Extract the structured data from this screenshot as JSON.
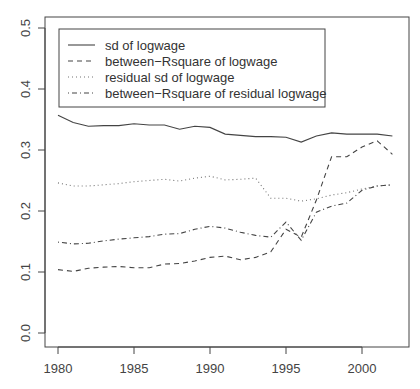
{
  "chart_data": {
    "type": "line",
    "title": "",
    "xlabel": "",
    "ylabel": "",
    "xlim": [
      1979,
      2003
    ],
    "ylim": [
      -0.02,
      0.52
    ],
    "grid": false,
    "legend_position": "top-left",
    "x_ticks": [
      1980,
      1985,
      1990,
      1995,
      2000
    ],
    "x_tick_labels": [
      "1980",
      "1985",
      "1990",
      "1995",
      "2000"
    ],
    "y_ticks": [
      0.0,
      0.1,
      0.2,
      0.3,
      0.4,
      0.5
    ],
    "y_tick_labels": [
      "0.0",
      "0.1",
      "0.2",
      "0.3",
      "0.4",
      "0.5"
    ],
    "x": [
      1980,
      1981,
      1982,
      1983,
      1984,
      1985,
      1986,
      1987,
      1988,
      1989,
      1990,
      1991,
      1992,
      1993,
      1994,
      1995,
      1996,
      1997,
      1998,
      1999,
      2000,
      2001,
      2002
    ],
    "series": [
      {
        "name": "sd of logwage",
        "line_style": "solid",
        "values": [
          0.357,
          0.345,
          0.339,
          0.34,
          0.34,
          0.343,
          0.341,
          0.341,
          0.334,
          0.339,
          0.337,
          0.326,
          0.324,
          0.322,
          0.322,
          0.321,
          0.313,
          0.323,
          0.328,
          0.326,
          0.326,
          0.326,
          0.323
        ]
      },
      {
        "name": "between-Rsquare of logwage",
        "line_style": "dashed",
        "values": [
          0.104,
          0.101,
          0.106,
          0.108,
          0.109,
          0.107,
          0.107,
          0.113,
          0.114,
          0.118,
          0.124,
          0.126,
          0.12,
          0.124,
          0.133,
          0.17,
          0.157,
          0.218,
          0.289,
          0.289,
          0.305,
          0.315,
          0.293
        ]
      },
      {
        "name": "residual sd of logwage",
        "line_style": "dotted",
        "values": [
          0.246,
          0.241,
          0.241,
          0.243,
          0.245,
          0.248,
          0.25,
          0.252,
          0.249,
          0.254,
          0.257,
          0.251,
          0.252,
          0.254,
          0.221,
          0.221,
          0.216,
          0.22,
          0.226,
          0.23,
          0.236,
          0.241,
          0.243
        ]
      },
      {
        "name": "between-Rsquare of residual logwage",
        "line_style": "dotdash",
        "values": [
          0.149,
          0.146,
          0.147,
          0.151,
          0.154,
          0.156,
          0.158,
          0.162,
          0.163,
          0.17,
          0.175,
          0.172,
          0.165,
          0.16,
          0.157,
          0.182,
          0.152,
          0.198,
          0.208,
          0.213,
          0.234,
          0.241,
          0.243
        ]
      }
    ]
  },
  "legend": {
    "items": [
      {
        "label": "sd of logwage",
        "style": "solid"
      },
      {
        "label": "between−Rsquare of logwage",
        "style": "dashed"
      },
      {
        "label": "residual sd of logwage",
        "style": "dotted"
      },
      {
        "label": "between−Rsquare of residual logwage",
        "style": "dotdash"
      }
    ]
  },
  "colors": {
    "line": "#444444",
    "axis": "#444444",
    "text": "#444444",
    "background": "#ffffff"
  }
}
